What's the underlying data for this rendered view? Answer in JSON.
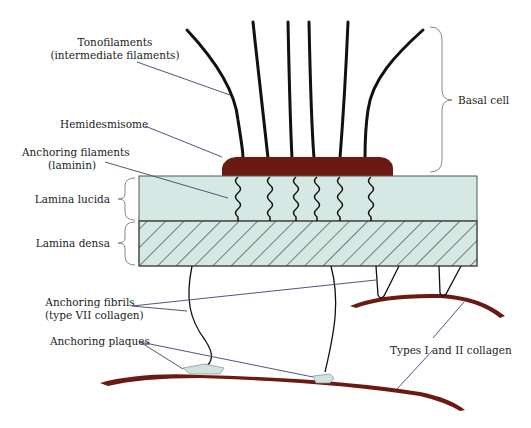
{
  "figure": {
    "colors": {
      "lamina": "#d6e8e3",
      "lamina_stroke": "#555555",
      "hemidesmosome": "#6b1a12",
      "collagen": "#6b1a12",
      "filament": "#111111",
      "leader": "#55557a",
      "brace": "#888888"
    },
    "labels": {
      "tonofilaments": "Tonofilaments",
      "tonofilaments_sub": "(intermediate filaments)",
      "hemidesmisome": "Hemidesmisome",
      "anchoring_filaments": "Anchoring filaments",
      "anchoring_filaments_sub": "(laminin)",
      "lamina_lucida": "Lamina lucida",
      "lamina_densa": "Lamina densa",
      "anchoring_fibrils": "Anchoring fibrils",
      "anchoring_fibrils_sub": "(type VII collagen)",
      "anchoring_plaques": "Anchoring plaques",
      "collagen": "Types I and II collagen",
      "basal_cell": "Basal cell"
    }
  }
}
